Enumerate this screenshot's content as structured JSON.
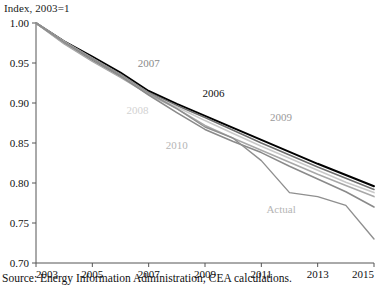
{
  "chart_data": {
    "type": "line",
    "title": "",
    "ylabel": "Index, 2003=1",
    "xlabel": "",
    "ylim": [
      0.7,
      1.0
    ],
    "xlim": [
      2003,
      2015
    ],
    "yticks": [
      "1.00",
      "0.95",
      "0.90",
      "0.85",
      "0.80",
      "0.75",
      "0.70"
    ],
    "ytick_values": [
      1.0,
      0.95,
      0.9,
      0.85,
      0.8,
      0.75,
      0.7
    ],
    "xticks": [
      "2003",
      "2005",
      "2007",
      "2009",
      "2011",
      "2013",
      "2015"
    ],
    "xtick_values": [
      2003,
      2005,
      2007,
      2009,
      2011,
      2013,
      2015
    ],
    "grid": false,
    "legend_position": "inline-annotations",
    "x": [
      2003,
      2004,
      2005,
      2006,
      2007,
      2008,
      2009,
      2010,
      2011,
      2012,
      2013,
      2014,
      2015
    ],
    "series": [
      {
        "name": "2006",
        "color": "#000000",
        "width": 2.0,
        "values": [
          1.0,
          0.977,
          0.958,
          0.938,
          0.915,
          0.899,
          0.884,
          0.869,
          0.854,
          0.839,
          0.824,
          0.81,
          0.796
        ]
      },
      {
        "name": "2007",
        "color": "#6e6e6e",
        "width": 1.6,
        "values": [
          1.0,
          0.975,
          0.953,
          0.933,
          0.913,
          0.897,
          0.882,
          0.866,
          0.85,
          0.835,
          0.82,
          0.806,
          0.792
        ]
      },
      {
        "name": "2008",
        "color": "#c9c9c9",
        "width": 1.6,
        "values": [
          1.0,
          0.977,
          0.956,
          0.935,
          0.912,
          0.895,
          0.878,
          0.862,
          0.846,
          0.831,
          0.816,
          0.801,
          0.788
        ]
      },
      {
        "name": "2009",
        "color": "#a8a8a8",
        "width": 1.6,
        "values": [
          1.0,
          0.974,
          0.952,
          0.932,
          0.911,
          0.893,
          0.872,
          0.856,
          0.841,
          0.826,
          0.811,
          0.797,
          0.783
        ]
      },
      {
        "name": "2010",
        "color": "#8a8a8a",
        "width": 1.6,
        "values": [
          1.0,
          0.976,
          0.955,
          0.934,
          0.91,
          0.888,
          0.867,
          0.852,
          0.838,
          0.821,
          0.805,
          0.789,
          0.77
        ]
      },
      {
        "name": "Actual",
        "color": "#8f8f8f",
        "width": 1.4,
        "values": [
          1.0,
          0.976,
          0.956,
          0.936,
          0.913,
          0.893,
          0.87,
          0.856,
          0.828,
          0.788,
          0.783,
          0.772,
          0.73
        ]
      }
    ],
    "annotations": [
      {
        "text": "2007",
        "x": 2007.0,
        "y": 0.945,
        "color": "#8a8a8a"
      },
      {
        "text": "2008",
        "x": 2006.6,
        "y": 0.886,
        "color": "#d2d2d2"
      },
      {
        "text": "2006",
        "x": 2009.3,
        "y": 0.908,
        "color": "#111111"
      },
      {
        "text": "2009",
        "x": 2011.7,
        "y": 0.878,
        "color": "#9a9a9a"
      },
      {
        "text": "2010",
        "x": 2008.0,
        "y": 0.843,
        "color": "#b5b5b5"
      },
      {
        "text": "Actual",
        "x": 2011.7,
        "y": 0.762,
        "color": "#b5b5b5"
      }
    ],
    "source": "Source: Energy Information Administration; CEA calculations."
  }
}
